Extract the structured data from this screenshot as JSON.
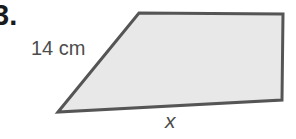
{
  "problem": {
    "number": "3."
  },
  "figure": {
    "shape": "trapezoid",
    "fill_color": "#e8e8e8",
    "stroke_color": "#555555",
    "vertices": {
      "bottom_left": [
        58,
        112
      ],
      "top_left": [
        139,
        13
      ],
      "top_right": [
        283,
        14
      ],
      "bottom_right": [
        282,
        100
      ]
    },
    "labels": {
      "slanted_side": "14 cm",
      "base": "x"
    }
  }
}
